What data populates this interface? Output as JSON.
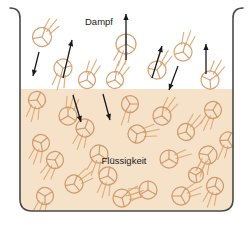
{
  "figure": {
    "width": 251,
    "height": 232,
    "background_color": "#ffffff"
  },
  "labels": {
    "vapor": "Dampf",
    "liquid": "Flüssigkeit"
  },
  "colors": {
    "liquid_fill": "#f6e2c9",
    "vapor_fill": "#ffffff",
    "molecule_stroke": "#d9a273",
    "molecule_stroke_liquid": "#cf9a6d",
    "motion_line": "#e0ab78",
    "arrow": "#1a1a1a",
    "container_wall": "#4a4a4a",
    "text": "#1a1a1a"
  },
  "container": {
    "left_x": 20,
    "right_x": 233,
    "top_y": 8,
    "bottom_y": 211,
    "wall_width": 1.6,
    "corner_radius": 12,
    "lip_radius": 10
  },
  "liquid_surface_y": 89,
  "molecules": {
    "vapor": [
      {
        "cx": 42,
        "cy": 37,
        "r": 9.5,
        "rot": 20,
        "trail_angle": 50,
        "trail_count": 3
      },
      {
        "cx": 63,
        "cy": 68,
        "r": 9.0,
        "rot": 75,
        "trail_angle": 255,
        "trail_count": 3
      },
      {
        "cx": 87,
        "cy": 80,
        "r": 8.5,
        "rot": 10,
        "trail_angle": 65,
        "trail_count": 3
      },
      {
        "cx": 115,
        "cy": 80,
        "r": 8.5,
        "rot": 130,
        "trail_angle": 60,
        "trail_count": 3
      },
      {
        "cx": 126,
        "cy": 44,
        "r": 10.0,
        "rot": 0,
        "trail_angle": 250,
        "trail_count": 3
      },
      {
        "cx": 157,
        "cy": 70,
        "r": 9.0,
        "rot": 40,
        "trail_angle": 60,
        "trail_count": 3
      },
      {
        "cx": 183,
        "cy": 52,
        "r": 9.0,
        "rot": 15,
        "trail_angle": 70,
        "trail_count": 3
      },
      {
        "cx": 210,
        "cy": 80,
        "r": 9.0,
        "rot": 55,
        "trail_angle": 60,
        "trail_count": 3
      }
    ],
    "liquid": [
      {
        "cx": 37,
        "cy": 100,
        "r": 8.5,
        "rot": 25,
        "trail_angle": 255,
        "trail_count": 3
      },
      {
        "cx": 68,
        "cy": 116,
        "r": 9.0,
        "rot": 0,
        "trail_angle": 75,
        "trail_count": 3
      },
      {
        "cx": 130,
        "cy": 104,
        "r": 8.5,
        "rot": 90,
        "trail_angle": 255,
        "trail_count": 2
      },
      {
        "cx": 162,
        "cy": 116,
        "r": 9.0,
        "rot": 10,
        "trail_angle": 55,
        "trail_count": 3
      },
      {
        "cx": 213,
        "cy": 110,
        "r": 8.5,
        "rot": 30,
        "trail_angle": 245,
        "trail_count": 3
      },
      {
        "cx": 41,
        "cy": 143,
        "r": 8.5,
        "rot": 50,
        "trail_angle": 250,
        "trail_count": 3
      },
      {
        "cx": 85,
        "cy": 128,
        "r": 9.0,
        "rot": 20,
        "trail_angle": 250,
        "trail_count": 3
      },
      {
        "cx": 99,
        "cy": 154,
        "r": 9.0,
        "rot": 5,
        "trail_angle": 250,
        "trail_count": 3
      },
      {
        "cx": 137,
        "cy": 134,
        "r": 9.0,
        "rot": 70,
        "trail_angle": 12,
        "trail_count": 3
      },
      {
        "cx": 186,
        "cy": 132,
        "r": 8.5,
        "rot": 15,
        "trail_angle": 50,
        "trail_count": 3
      },
      {
        "cx": 208,
        "cy": 155,
        "r": 9.0,
        "rot": 40,
        "trail_angle": 250,
        "trail_count": 3
      },
      {
        "cx": 169,
        "cy": 159,
        "r": 9.0,
        "rot": 0,
        "trail_angle": 20,
        "trail_count": 2
      },
      {
        "cx": 55,
        "cy": 160,
        "r": 8.5,
        "rot": 35,
        "trail_angle": 240,
        "trail_count": 3
      },
      {
        "cx": 74,
        "cy": 184,
        "r": 9.0,
        "rot": 20,
        "trail_angle": 35,
        "trail_count": 3
      },
      {
        "cx": 45,
        "cy": 196,
        "r": 8.5,
        "rot": 60,
        "trail_angle": 250,
        "trail_count": 3
      },
      {
        "cx": 108,
        "cy": 176,
        "r": 9.0,
        "rot": 10,
        "trail_angle": 255,
        "trail_count": 3
      },
      {
        "cx": 122,
        "cy": 198,
        "r": 9.0,
        "rot": 45,
        "trail_angle": 20,
        "trail_count": 3
      },
      {
        "cx": 148,
        "cy": 190,
        "r": 9.0,
        "rot": 0,
        "trail_angle": 195,
        "trail_count": 3
      },
      {
        "cx": 181,
        "cy": 196,
        "r": 9.0,
        "rot": 30,
        "trail_angle": 25,
        "trail_count": 3
      },
      {
        "cx": 215,
        "cy": 186,
        "r": 8.5,
        "rot": 15,
        "trail_angle": 250,
        "trail_count": 3
      },
      {
        "cx": 196,
        "cy": 175,
        "r": 7.5,
        "rot": 55,
        "trail_angle": 60,
        "trail_count": 2
      },
      {
        "cx": 228,
        "cy": 140,
        "r": 8.0,
        "rot": 25,
        "trail_angle": 250,
        "trail_count": 2
      }
    ]
  },
  "arrows": [
    {
      "name": "arrow-condense-left",
      "x1": 39,
      "y1": 52,
      "x2": 33,
      "y2": 76,
      "direction": "down"
    },
    {
      "name": "arrow-evaporate-1",
      "x1": 63,
      "y1": 78,
      "x2": 72,
      "y2": 40,
      "direction": "up"
    },
    {
      "name": "arrow-evaporate-2",
      "x1": 126,
      "y1": 60,
      "x2": 126,
      "y2": 14,
      "direction": "up"
    },
    {
      "name": "arrow-evaporate-3",
      "x1": 152,
      "y1": 78,
      "x2": 162,
      "y2": 46,
      "direction": "up"
    },
    {
      "name": "arrow-condense-mid",
      "x1": 178,
      "y1": 66,
      "x2": 169,
      "y2": 90,
      "direction": "down"
    },
    {
      "name": "arrow-evaporate-4",
      "x1": 206,
      "y1": 74,
      "x2": 206,
      "y2": 44,
      "direction": "up"
    },
    {
      "name": "arrow-condense-in-1",
      "x1": 73,
      "y1": 95,
      "x2": 81,
      "y2": 122,
      "direction": "down"
    },
    {
      "name": "arrow-condense-in-2",
      "x1": 103,
      "y1": 94,
      "x2": 110,
      "y2": 120,
      "direction": "down"
    }
  ],
  "label_positions": {
    "vapor": {
      "x": 99,
      "y": 22
    },
    "liquid": {
      "x": 124,
      "y": 161
    }
  }
}
